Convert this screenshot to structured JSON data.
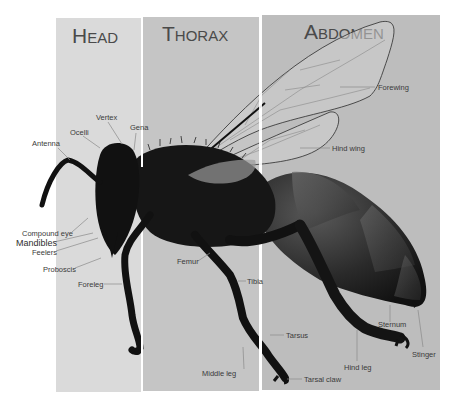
{
  "diagram": {
    "sections": [
      {
        "id": "head",
        "initial": "H",
        "rest": "EAD",
        "color": "#d9d9d9"
      },
      {
        "id": "thorax",
        "initial": "T",
        "rest": "HORAX",
        "color": "#c4c4c4"
      },
      {
        "id": "abdomen",
        "initial": "A",
        "rest": "BDOMEN",
        "color": "#bcbcbc"
      }
    ],
    "labels": {
      "antenna": "Antenna",
      "ocelli": "Ocelli",
      "vertex": "Vertex",
      "gena": "Gena",
      "compound_eye": "Compound eye",
      "mandibles": "Mandibles",
      "feelers": "Feelers",
      "proboscis": "Proboscis",
      "foreleg": "Foreleg",
      "femur": "Femur",
      "tibia": "Tibia",
      "tarsus": "Tarsus",
      "middle_leg": "Middle leg",
      "tarsal_claw": "Tarsal claw",
      "forewing": "Forewing",
      "hind_wing": "Hind wing",
      "hind_leg": "Hind leg",
      "sternum": "Sternum",
      "stinger": "Stinger"
    },
    "colors": {
      "body": "#151515",
      "abdomen_band": "#3a3a3a",
      "wing_fill": "#c8c8c8",
      "wing_outline": "#3c3c3c",
      "text": "#3a3a3a",
      "divider": "#ffffff"
    }
  }
}
